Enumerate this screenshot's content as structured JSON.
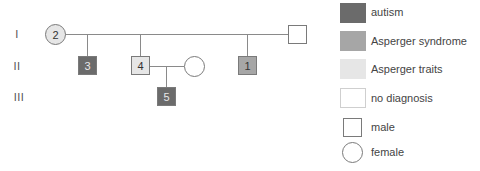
{
  "generations": [
    {
      "label": "I"
    },
    {
      "label": "II"
    },
    {
      "label": "III"
    }
  ],
  "individuals": [
    {
      "id": "2",
      "label": "2",
      "sex": "female",
      "generation": "I",
      "status": "asperger_traits"
    },
    {
      "id": "I-male",
      "label": "",
      "sex": "male",
      "generation": "I",
      "status": "no_diagnosis"
    },
    {
      "id": "3",
      "label": "3",
      "sex": "male",
      "generation": "II",
      "status": "autism"
    },
    {
      "id": "4",
      "label": "4",
      "sex": "male",
      "generation": "II",
      "status": "asperger_traits"
    },
    {
      "id": "II-spouse",
      "label": "",
      "sex": "female",
      "generation": "II",
      "status": "no_diagnosis"
    },
    {
      "id": "1",
      "label": "1",
      "sex": "male",
      "generation": "II",
      "status": "asperger_syndrome"
    },
    {
      "id": "5",
      "label": "5",
      "sex": "male",
      "generation": "III",
      "status": "autism"
    }
  ],
  "legend": {
    "items": [
      {
        "key": "autism",
        "label": "autism",
        "color": "#6b6b6b"
      },
      {
        "key": "asperger_syndrome",
        "label": "Asperger syndrome",
        "color": "#a6a6a6"
      },
      {
        "key": "asperger_traits",
        "label": "Asperger traits",
        "color": "#e6e6e6"
      },
      {
        "key": "no_diagnosis",
        "label": "no diagnosis",
        "color": "#ffffff"
      }
    ],
    "sex_items": [
      {
        "key": "male",
        "label": "male",
        "shape": "square"
      },
      {
        "key": "female",
        "label": "female",
        "shape": "circle"
      }
    ]
  },
  "colors": {
    "autism": "#6b6b6b",
    "asperger_syndrome": "#a6a6a6",
    "asperger_traits": "#e6e6e6",
    "no_diagnosis": "#ffffff",
    "line": "#8a8a8a"
  }
}
